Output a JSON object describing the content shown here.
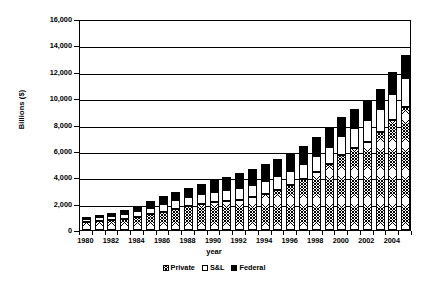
{
  "chart_data": {
    "type": "bar",
    "stacked": true,
    "title": "",
    "xlabel": "year",
    "ylabel": "Billions ($)",
    "ylim": [
      0,
      16000
    ],
    "ytick_step": 2000,
    "ytick_labels": [
      "16,000",
      "14,000",
      "12,000",
      "10,000",
      "8,000",
      "6,000",
      "4,000",
      "2,000",
      "0"
    ],
    "ytick_values": [
      16000,
      14000,
      12000,
      10000,
      8000,
      6000,
      4000,
      2000,
      0
    ],
    "grid": true,
    "legend_position": "bottom",
    "categories": [
      "1980",
      "1981",
      "1982",
      "1983",
      "1984",
      "1985",
      "1986",
      "1987",
      "1988",
      "1989",
      "1990",
      "1991",
      "1992",
      "1993",
      "1994",
      "1995",
      "1996",
      "1997",
      "1998",
      "1999",
      "2000",
      "2001",
      "2002",
      "2003",
      "2004",
      "2005"
    ],
    "xtick_labels": [
      "1980",
      "1982",
      "1984",
      "1986",
      "1988",
      "1990",
      "1992",
      "1994",
      "1996",
      "1998",
      "2000",
      "2002",
      "2004"
    ],
    "series": [
      {
        "name": "Private",
        "fill": "crosshatch",
        "color": "#000000",
        "values": [
          600,
          680,
          740,
          840,
          1000,
          1200,
          1400,
          1600,
          1800,
          2000,
          2150,
          2200,
          2300,
          2500,
          2750,
          3050,
          3400,
          3850,
          4400,
          5000,
          5700,
          6250,
          6700,
          7400,
          8350,
          9350
        ]
      },
      {
        "name": "S&L",
        "fill": "white",
        "color": "#ffffff",
        "values": [
          250,
          280,
          320,
          360,
          420,
          500,
          600,
          640,
          680,
          700,
          760,
          820,
          900,
          950,
          1000,
          1050,
          1100,
          1150,
          1200,
          1300,
          1400,
          1500,
          1650,
          1800,
          2000,
          2200
        ]
      },
      {
        "name": "Federal",
        "fill": "solid",
        "color": "#000000",
        "values": [
          160,
          200,
          260,
          340,
          400,
          480,
          560,
          640,
          720,
          800,
          900,
          1000,
          1100,
          1200,
          1250,
          1300,
          1350,
          1400,
          1450,
          1500,
          1450,
          1400,
          1400,
          1500,
          1600,
          1700
        ]
      }
    ],
    "totals": [
      1010,
      1160,
      1320,
      1540,
      1820,
      2180,
      2560,
      2880,
      3200,
      3500,
      3810,
      4020,
      4300,
      4650,
      5000,
      5400,
      5850,
      6400,
      7050,
      7800,
      8550,
      9150,
      9750,
      10700,
      11950,
      13250
    ]
  },
  "legend": {
    "items": [
      {
        "label": "Private"
      },
      {
        "label": "S&L"
      },
      {
        "label": "Federal"
      }
    ]
  }
}
